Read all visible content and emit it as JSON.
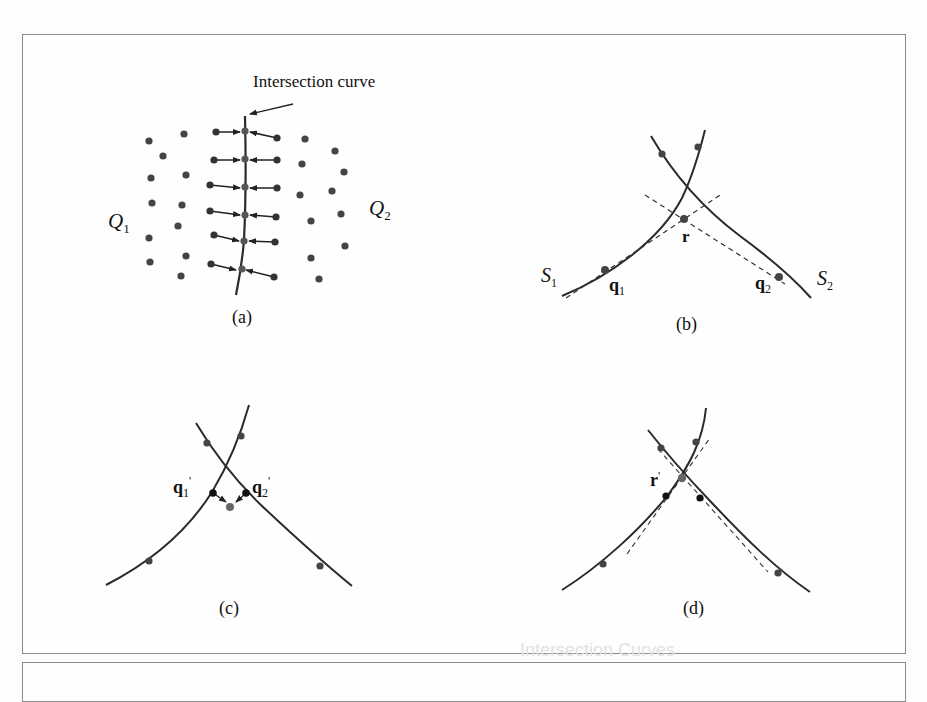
{
  "figure": {
    "panels": [
      {
        "id": "a",
        "caption": "(a)",
        "annotation": "Intersection curve",
        "labels": {
          "left_set": "Q",
          "left_sub": "1",
          "right_set": "Q",
          "right_sub": "2"
        }
      },
      {
        "id": "b",
        "caption": "(b)",
        "labels": {
          "surface1": "S",
          "surface1_sub": "1",
          "surface2": "S",
          "surface2_sub": "2",
          "point_q1": "q",
          "point_q1_sub": "1",
          "point_q2": "q",
          "point_q2_sub": "2",
          "point_r": "r"
        }
      },
      {
        "id": "c",
        "caption": "(c)",
        "labels": {
          "point_q1p": "q",
          "point_q1p_sub": "1",
          "point_q1p_prime": "'",
          "point_q2p": "q",
          "point_q2p_sub": "2",
          "point_q2p_prime": "'"
        }
      },
      {
        "id": "d",
        "caption": "(d)",
        "labels": {
          "point_rp": "r",
          "point_rp_prime": "'"
        }
      }
    ],
    "ghost_text": "Intersection Curves"
  },
  "colors": {
    "frame": "#8a8a8a",
    "curve": "#2a2a2a",
    "point": "#444444",
    "point_dark": "#111111",
    "dashed": "#333333"
  }
}
